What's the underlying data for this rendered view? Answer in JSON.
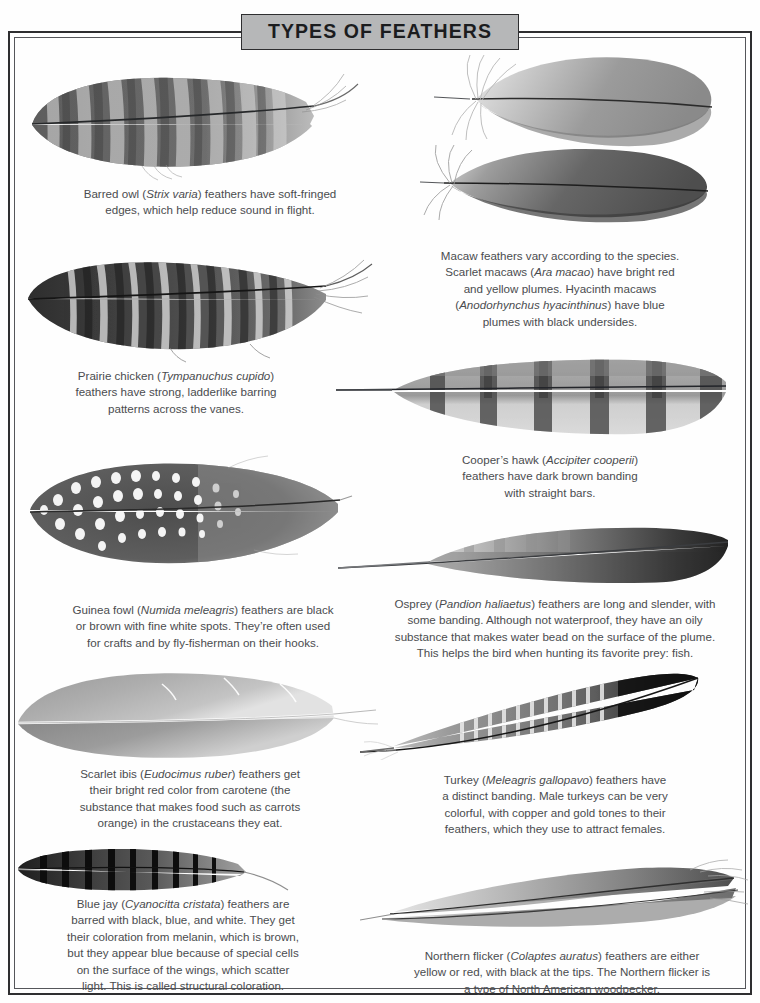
{
  "title": "TYPES OF FEATHERS",
  "colors": {
    "title_plaque_bg": "#b6b7b8",
    "frame": "#2e2e30",
    "text": "#4a4c4f",
    "page_bg": "#ffffff"
  },
  "entries": [
    {
      "id": "barred-owl",
      "common_name": "Barred owl",
      "scientific_name": "Strix varia",
      "caption_lines": [
        "Barred owl (Strix varia) feathers have soft-fringed",
        "edges, which help reduce sound in flight."
      ],
      "caption_text": "Barred owl (Strix varia) feathers have soft-fringed edges, which help reduce sound in flight.",
      "pattern": "barred",
      "feather_count": 1
    },
    {
      "id": "macaw",
      "common_name": "Macaw",
      "scientific_name": "Ara macao; Anodorhynchus hyacinthinus",
      "caption_lines": [
        "Macaw feathers vary according to the species.",
        "Scarlet macaws (Ara macao) have bright red",
        "and yellow plumes. Hyacinth macaws",
        "(Anodorhynchus hyacinthinus) have blue",
        "plumes with black undersides."
      ],
      "caption_text": "Macaw feathers vary according to the species. Scarlet macaws (Ara macao) have bright red and yellow plumes. Hyacinth macaws (Anodorhynchus hyacinthinus) have blue plumes with black undersides.",
      "pattern": "solid-rounded",
      "feather_count": 2
    },
    {
      "id": "prairie-chicken",
      "common_name": "Prairie chicken",
      "scientific_name": "Tympanuchus cupido",
      "caption_lines": [
        "Prairie chicken (Tympanuchus cupido)",
        "feathers have strong, ladderlike barring",
        "patterns across the vanes."
      ],
      "caption_text": "Prairie chicken (Tympanuchus cupido) feathers have strong, ladderlike barring patterns across the vanes.",
      "pattern": "ladder-barred",
      "feather_count": 1
    },
    {
      "id": "coopers-hawk",
      "common_name": "Cooper's hawk",
      "scientific_name": "Accipiter cooperii",
      "caption_lines": [
        "Cooper’s hawk (Accipiter cooperii)",
        "feathers have dark brown banding",
        "with straight bars."
      ],
      "caption_text": "Cooper’s hawk (Accipiter cooperii) feathers have dark brown banding with straight bars.",
      "pattern": "straight-bars",
      "feather_count": 1
    },
    {
      "id": "guinea-fowl",
      "common_name": "Guinea fowl",
      "scientific_name": "Numida meleagris",
      "caption_lines": [
        "Guinea fowl (Numida meleagris) feathers are black",
        "or brown with fine white spots. They’re often used",
        "for crafts and by fly-fisherman on their hooks."
      ],
      "caption_text": "Guinea fowl (Numida meleagris) feathers are black or brown with fine white spots. They’re often used for crafts and by fly-fisherman on their hooks.",
      "pattern": "spotted",
      "feather_count": 1
    },
    {
      "id": "osprey",
      "common_name": "Osprey",
      "scientific_name": "Pandion haliaetus",
      "caption_lines": [
        "Osprey (Pandion haliaetus) feathers are long and slender, with",
        "some banding. Although not waterproof, they have an oily",
        "substance that makes water bead on the surface of the plume.",
        "This helps the bird when hunting its favorite prey: fish."
      ],
      "caption_text": "Osprey (Pandion haliaetus) feathers are long and slender, with some banding. Although not waterproof, they have an oily substance that makes water bead on the surface of the plume. This helps the bird when hunting its favorite prey: fish.",
      "pattern": "slender-dark-tip",
      "feather_count": 1
    },
    {
      "id": "scarlet-ibis",
      "common_name": "Scarlet ibis",
      "scientific_name": "Eudocimus ruber",
      "caption_lines": [
        "Scarlet ibis (Eudocimus ruber) feathers get",
        "their bright red color from carotene (the",
        "substance that makes food such as carrots",
        "orange) in the crustaceans they eat."
      ],
      "caption_text": "Scarlet ibis (Eudocimus ruber) feathers get their bright red color from carotene (the substance that makes food such as carrots orange) in the crustaceans they eat.",
      "pattern": "solid-smooth",
      "feather_count": 1
    },
    {
      "id": "turkey",
      "common_name": "Turkey",
      "scientific_name": "Meleagris gallopavo",
      "caption_lines": [
        "Turkey (Meleagris gallopavo) feathers have",
        "a distinct banding. Male turkeys can be very",
        "colorful, with copper and gold tones to their",
        "feathers, which they use to attract females."
      ],
      "caption_text": "Turkey (Meleagris gallopavo) feathers have a distinct banding. Male turkeys can be very colorful, with copper and gold tones to their feathers, which they use to attract females.",
      "pattern": "fine-banded-black-tip",
      "feather_count": 1
    },
    {
      "id": "blue-jay",
      "common_name": "Blue jay",
      "scientific_name": "Cyanocitta cristata",
      "caption_lines": [
        "Blue jay (Cyanocitta cristata) feathers are",
        "barred with black, blue, and white. They get",
        "their coloration from melanin, which is brown,",
        "but they appear blue because of special cells",
        "on the surface of the wings, which scatter",
        "light. This is called structural coloration."
      ],
      "caption_text": "Blue jay (Cyanocitta cristata) feathers are barred with black, blue, and white. They get their coloration from melanin, which is brown, but they appear blue because of special cells on the surface of the wings, which scatter light. This is called structural coloration.",
      "pattern": "narrow-barred",
      "feather_count": 1
    },
    {
      "id": "northern-flicker",
      "common_name": "Northern flicker",
      "scientific_name": "Colaptes auratus",
      "caption_lines": [
        "Northern flicker (Colaptes auratus) feathers are either",
        "yellow or red, with black at the tips. The Northern flicker is",
        "a type of North American woodpecker."
      ],
      "caption_text": "Northern flicker (Colaptes auratus) feathers are either yellow or red, with black at the tips. The Northern flicker is a type of North American woodpecker.",
      "pattern": "slender-pointed",
      "feather_count": 2
    }
  ]
}
